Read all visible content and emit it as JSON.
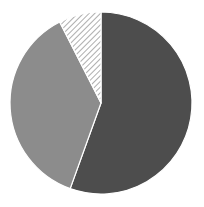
{
  "chart_data": {
    "type": "pie",
    "title": "",
    "start_angle_deg": 0,
    "direction": "clockwise",
    "center": [
      101,
      103
    ],
    "radius": 91,
    "legend": "none",
    "slices": [
      {
        "label": "",
        "value": 55.5,
        "fill": "#4d4d4d",
        "pattern": "solid"
      },
      {
        "label": "",
        "value": 37.0,
        "fill": "#8c8c8c",
        "pattern": "solid"
      },
      {
        "label": "",
        "value": 7.5,
        "fill": "#ffffff",
        "pattern": "hatch",
        "hatch_color": "#9a9a9a"
      }
    ],
    "separator_color": "#ffffff"
  }
}
